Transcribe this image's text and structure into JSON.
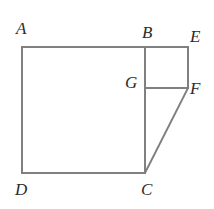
{
  "figure": {
    "name": "geometry-figure-square-with-attached-rectangle-and-triangle",
    "background_color": "#ffffff",
    "stroke_color": "#808080",
    "stroke_width": 2,
    "label_color": "#2b2b2b",
    "canvas": {
      "width": 214,
      "height": 209
    }
  },
  "labels": {
    "a": "A",
    "b": "B",
    "c": "C",
    "d": "D",
    "e": "E",
    "f": "F",
    "g": "G"
  },
  "points": {
    "A": {
      "x": 22,
      "y": 47
    },
    "B": {
      "x": 145,
      "y": 47
    },
    "C": {
      "x": 145,
      "y": 173
    },
    "D": {
      "x": 22,
      "y": 173
    },
    "E": {
      "x": 188,
      "y": 47
    },
    "F": {
      "x": 188,
      "y": 88
    },
    "G": {
      "x": 145,
      "y": 88
    }
  },
  "shapes": {
    "square_abcd": "M22,47 L145,47 L145,173 L22,173 Z",
    "rectangle_befg": "M145,47 L188,47 L188,88 L145,88 Z",
    "segment_gf": "M145,88 L188,88",
    "segment_cf": "M145,173 L188,88"
  }
}
